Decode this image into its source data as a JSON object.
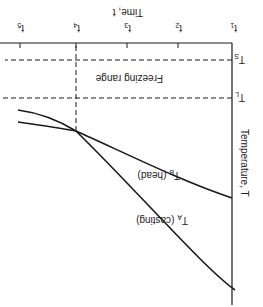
{
  "diagram": {
    "title": "",
    "orientation": "rotated 180 degrees",
    "x_axis": {
      "label": "Time, t",
      "ticks": [
        "t1",
        "t2",
        "t3",
        "t4",
        "t5"
      ]
    },
    "y_axis": {
      "label": "Temperature, T",
      "levels": [
        "T_L",
        "T_S"
      ]
    },
    "level_labels": {
      "liquidus": "T",
      "liquidus_sub": "L",
      "solidus": "T",
      "solidus_sub": "S"
    },
    "tick_labels": [
      {
        "main": "t",
        "sub": "1"
      },
      {
        "main": "t",
        "sub": "2"
      },
      {
        "main": "t",
        "sub": "3"
      },
      {
        "main": "t",
        "sub": "4"
      },
      {
        "main": "t",
        "sub": "5"
      }
    ],
    "region_label": "Freezing range",
    "curves": [
      {
        "name": "T_A (casting)",
        "main": "T",
        "sub": "A",
        "suffix": " (casting)"
      },
      {
        "name": "T_B (head)",
        "main": "T",
        "sub": "B",
        "suffix": " (head)"
      }
    ],
    "stroke_color": "#1a1a1a"
  }
}
